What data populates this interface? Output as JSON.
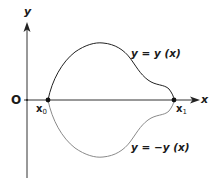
{
  "diagram": {
    "axes": {
      "x_label": "x",
      "y_label": "y",
      "origin_label": "O"
    },
    "points": {
      "x0": {
        "main": "x",
        "sub": "0"
      },
      "x1": {
        "main": "x",
        "sub": "1"
      }
    },
    "curves": {
      "upper": {
        "label": "y = y (x)",
        "color": "#222222"
      },
      "lower": {
        "label": "y = −y (x)",
        "color": "#8a8a8a"
      }
    },
    "colors": {
      "axis": "#333333",
      "background": "#ffffff"
    }
  }
}
